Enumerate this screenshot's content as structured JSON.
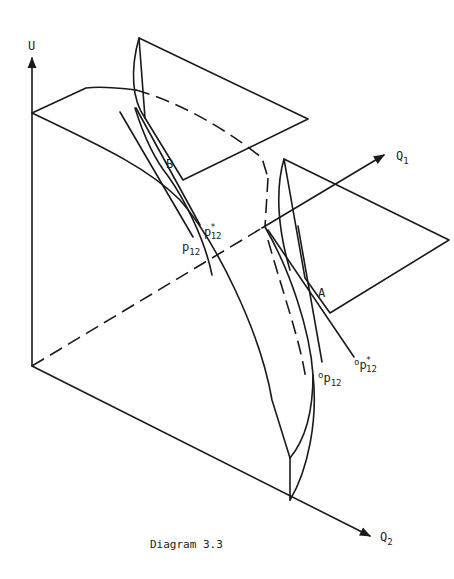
{
  "diagram": {
    "caption": "Diagram 3.3",
    "axes": {
      "vertical": "U",
      "horizontal_right": "Q",
      "horizontal_right_sub": "1",
      "horizontal_down": "Q",
      "horizontal_down_sub": "2"
    },
    "points": {
      "upper": "B",
      "lower": "A"
    },
    "price_labels": {
      "B_star": "p",
      "B_star_sub": "12",
      "B_star_sup": "*",
      "B_plain": "p",
      "B_plain_sub": "12",
      "A_star_prefix": "o",
      "A_star": "p",
      "A_star_sub": "12",
      "A_star_sup": "*",
      "A_plain_prefix": "o",
      "A_plain": "p",
      "A_plain_sub": "12"
    },
    "colors": {
      "ink": "#1a1a1a",
      "background": "#ffffff"
    }
  }
}
